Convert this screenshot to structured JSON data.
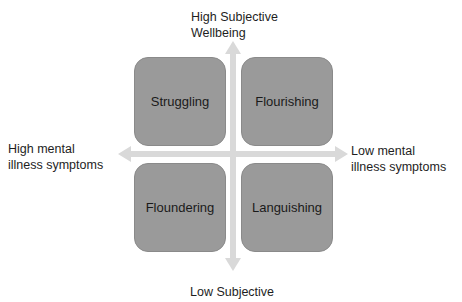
{
  "axes": {
    "top_label_line1": "High Subjective",
    "top_label_line2": "Wellbeing",
    "bottom_label": "Low Subjective",
    "left_label_line1": "High mental",
    "left_label_line2": "illness symptoms",
    "right_label_line1": "Low mental",
    "right_label_line2": "illness symptoms"
  },
  "quadrants": [
    {
      "position": "top-left",
      "label": "Struggling"
    },
    {
      "position": "top-right",
      "label": "Flourishing"
    },
    {
      "position": "bottom-left",
      "label": "Floundering"
    },
    {
      "position": "bottom-right",
      "label": "Languishing"
    }
  ],
  "colors": {
    "box_fill": "#9a9a9a",
    "arrow": "#d9d9d9",
    "text": "#1e1e1e"
  }
}
